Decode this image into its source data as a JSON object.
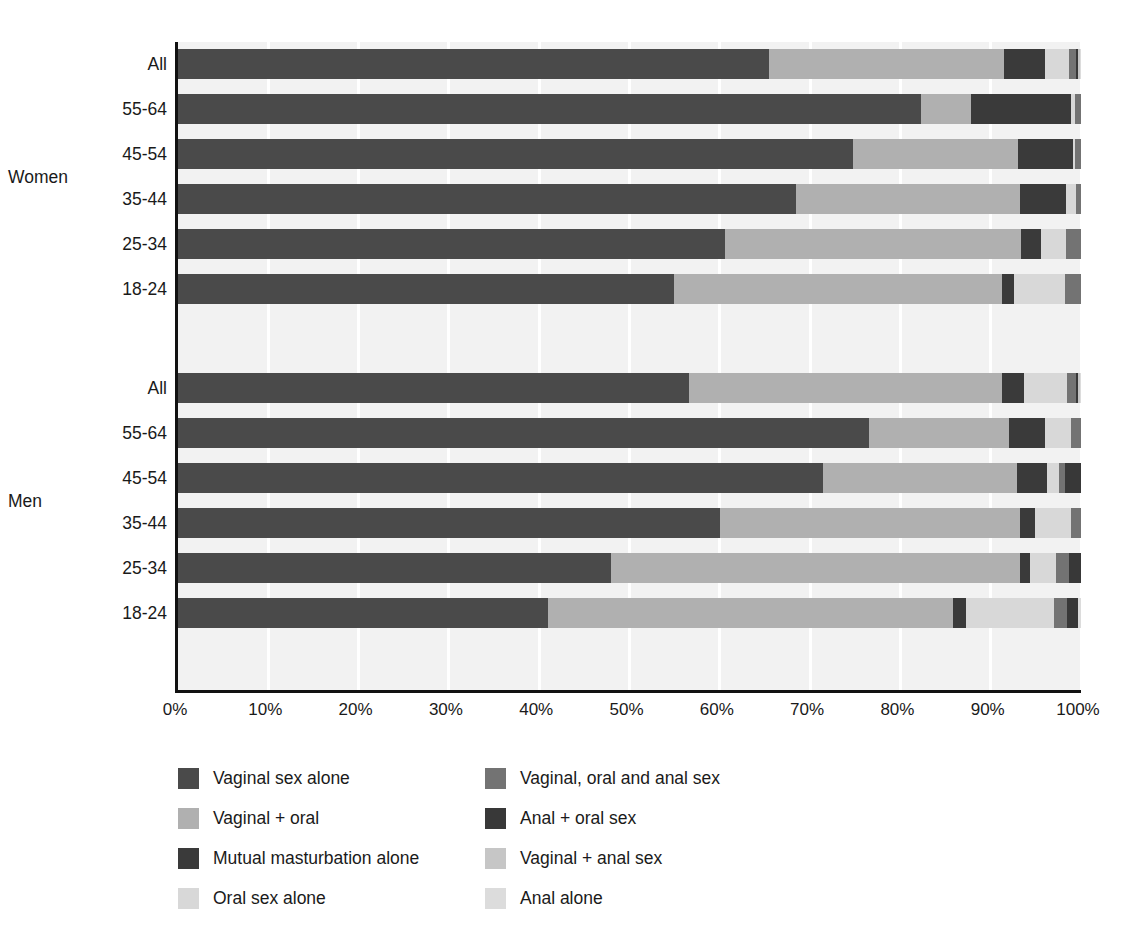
{
  "chart_data": {
    "type": "bar",
    "subtype": "stacked-horizontal-100pct",
    "title": "",
    "xlabel": "",
    "ylabel": "",
    "xlim": [
      0,
      100
    ],
    "xticks": [
      "0%",
      "10%",
      "20%",
      "30%",
      "40%",
      "50%",
      "60%",
      "70%",
      "80%",
      "90%",
      "100%"
    ],
    "xtick_values": [
      0,
      10,
      20,
      30,
      40,
      50,
      60,
      70,
      80,
      90,
      100
    ],
    "grid": true,
    "legend_position": "bottom",
    "groups": [
      "Women",
      "Men"
    ],
    "categories": [
      "All",
      "55-64",
      "45-54",
      "35-44",
      "25-34",
      "18-24"
    ],
    "series": [
      {
        "name": "Vaginal sex alone",
        "color": "#4a4a4a"
      },
      {
        "name": "Vaginal + oral",
        "color": "#b0b0b0"
      },
      {
        "name": "Mutual masturbation alone",
        "color": "#3a3a3a"
      },
      {
        "name": "Oral sex alone",
        "color": "#d8d8d8"
      },
      {
        "name": "Vaginal, oral and anal sex",
        "color": "#737373"
      },
      {
        "name": "Anal + oral sex",
        "color": "#383838"
      },
      {
        "name": "Vaginal + anal sex",
        "color": "#c6c6c6"
      },
      {
        "name": "Anal alone",
        "color": "#dcdcdc"
      }
    ],
    "rows": [
      {
        "group": "Women",
        "category": "All",
        "values": [
          65.4,
          26.1,
          4.5,
          2.7,
          0.7,
          0.3,
          0.2,
          0.1
        ]
      },
      {
        "group": "Women",
        "category": "55-64",
        "values": [
          82.3,
          5.5,
          11.1,
          0.4,
          0.7,
          0.0,
          0.0,
          0.0
        ]
      },
      {
        "group": "Women",
        "category": "45-54",
        "values": [
          74.8,
          18.2,
          6.1,
          0.2,
          0.7,
          0.0,
          0.0,
          0.0
        ]
      },
      {
        "group": "Women",
        "category": "35-44",
        "values": [
          68.4,
          24.9,
          5.0,
          1.1,
          0.6,
          0.0,
          0.0,
          0.0
        ]
      },
      {
        "group": "Women",
        "category": "25-34",
        "values": [
          60.6,
          32.8,
          2.2,
          2.7,
          1.7,
          0.0,
          0.0,
          0.0
        ]
      },
      {
        "group": "Women",
        "category": "18-24",
        "values": [
          54.9,
          36.3,
          1.4,
          5.6,
          1.8,
          0.0,
          0.0,
          0.0
        ]
      },
      {
        "group": "Men",
        "category": "All",
        "values": [
          56.6,
          34.7,
          2.4,
          4.7,
          1.0,
          0.3,
          0.2,
          0.1
        ]
      },
      {
        "group": "Men",
        "category": "55-64",
        "values": [
          76.5,
          15.5,
          4.0,
          2.9,
          1.1,
          0.0,
          0.0,
          0.0
        ]
      },
      {
        "group": "Men",
        "category": "45-54",
        "values": [
          71.4,
          21.5,
          3.3,
          1.4,
          0.6,
          1.8,
          0.0,
          0.0
        ]
      },
      {
        "group": "Men",
        "category": "35-44",
        "values": [
          60.0,
          33.2,
          1.7,
          4.0,
          1.1,
          0.0,
          0.0,
          0.0
        ]
      },
      {
        "group": "Men",
        "category": "25-34",
        "values": [
          48.0,
          45.3,
          1.0,
          2.9,
          1.5,
          1.3,
          0.0,
          0.0
        ]
      },
      {
        "group": "Men",
        "category": "18-24",
        "values": [
          41.0,
          44.8,
          1.5,
          9.7,
          1.4,
          1.3,
          0.0,
          0.3
        ]
      }
    ]
  },
  "axis": {
    "group_women": "Women",
    "group_men": "Men",
    "tick_labels": [
      "0%",
      "10%",
      "20%",
      "30%",
      "40%",
      "50%",
      "60%",
      "70%",
      "80%",
      "90%",
      "100%"
    ],
    "category_labels": [
      "All",
      "55-64",
      "45-54",
      "35-44",
      "25-34",
      "18-24"
    ]
  },
  "legend": {
    "left_column": [
      {
        "label": "Vaginal sex alone",
        "color": "#4a4a4a"
      },
      {
        "label": "Vaginal + oral",
        "color": "#b0b0b0"
      },
      {
        "label": "Mutual masturbation alone",
        "color": "#3a3a3a"
      },
      {
        "label": "Oral sex alone",
        "color": "#d8d8d8"
      }
    ],
    "right_column": [
      {
        "label": "Vaginal, oral and anal sex",
        "color": "#737373"
      },
      {
        "label": "Anal + oral sex",
        "color": "#383838"
      },
      {
        "label": "Vaginal + anal sex",
        "color": "#c6c6c6"
      },
      {
        "label": "Anal alone",
        "color": "#dcdcdc"
      }
    ]
  }
}
